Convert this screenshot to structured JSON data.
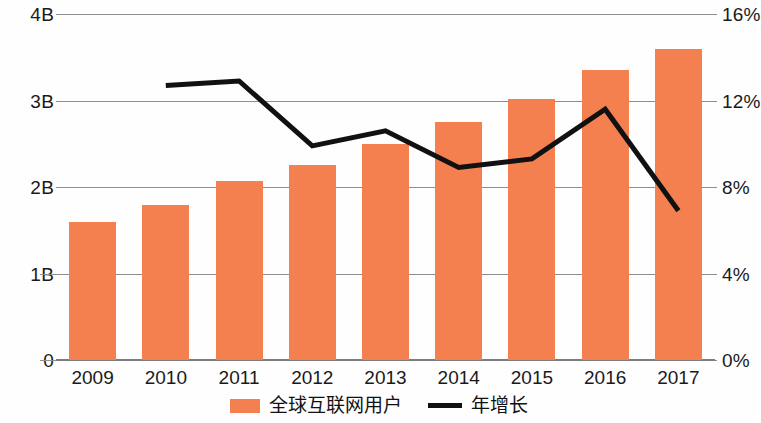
{
  "chart_data": {
    "type": "bar",
    "title": "",
    "subtitle": "",
    "xlabel": "",
    "ylabel": "",
    "categories": [
      "2009",
      "2010",
      "2011",
      "2012",
      "2013",
      "2014",
      "2015",
      "2016",
      "2017"
    ],
    "grid": true,
    "legend_position": "bottom",
    "series": [
      {
        "name": "全球互联网用户",
        "type": "bar",
        "axis": "left",
        "color": "#F5804F",
        "values": [
          1.6,
          1.79,
          2.07,
          2.25,
          2.5,
          2.75,
          3.02,
          3.35,
          3.6
        ],
        "value_labels": [
          "1.6B",
          "1.79B",
          "2.07B",
          "2.25B",
          "2.5B",
          "2.75B",
          "3.02B",
          "3.35B",
          "3.6B"
        ]
      },
      {
        "name": "年增长",
        "type": "line",
        "axis": "right",
        "color": "#111111",
        "values": [
          null,
          12.7,
          12.9,
          9.9,
          10.6,
          8.9,
          9.3,
          11.6,
          6.9
        ],
        "value_labels": [
          "",
          "12.7%",
          "12.9%",
          "9.9%",
          "10.6%",
          "8.9%",
          "9.3%",
          "11.6%",
          "6.9%"
        ]
      }
    ],
    "left_axis": {
      "label": "",
      "ticks": [
        "0",
        "1B",
        "2B",
        "3B",
        "4B"
      ],
      "tick_values": [
        0,
        1,
        2,
        3,
        4
      ],
      "ylim": [
        0,
        4
      ]
    },
    "right_axis": {
      "label": "",
      "ticks": [
        "0%",
        "4%",
        "8%",
        "12%",
        "16%"
      ],
      "tick_values": [
        0,
        4,
        8,
        12,
        16
      ],
      "ylim": [
        0,
        16
      ]
    }
  },
  "legend": {
    "items": [
      {
        "label": "全球互联网用户",
        "marker": "bar-swatch",
        "color": "#F5804F"
      },
      {
        "label": "年增长",
        "marker": "line-swatch",
        "color": "#111111"
      }
    ]
  }
}
